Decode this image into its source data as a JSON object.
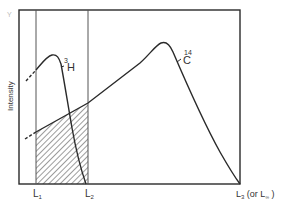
{
  "diagram": {
    "type": "spectrum-overlap",
    "ylabel": "Intensity",
    "corner_mark": "Y",
    "curves": [
      {
        "id": "tritium",
        "label_mass": "3",
        "label_element": "H",
        "description": "low-energy spectrum, peak near left, ends at L2"
      },
      {
        "id": "carbon14",
        "label_mass": "14",
        "label_element": "C",
        "description": "higher-energy spectrum, peak near right, ends at L3"
      }
    ],
    "x_markers": [
      {
        "id": "L1",
        "text": "L",
        "sub": "1"
      },
      {
        "id": "L2",
        "text": "L",
        "sub": "2"
      },
      {
        "id": "L3",
        "text": "L",
        "sub": "3",
        "suffix_open": " (or L",
        "suffix_sub": "∞",
        "suffix_close": " )"
      }
    ],
    "shaded_region": "area between L1 and L2 under the 14C curve (hatched)",
    "colors": {
      "line": "#2a2a2a",
      "frame": "#2a2a2a",
      "hatch": "#3a3a3a",
      "background": "#ffffff"
    }
  }
}
